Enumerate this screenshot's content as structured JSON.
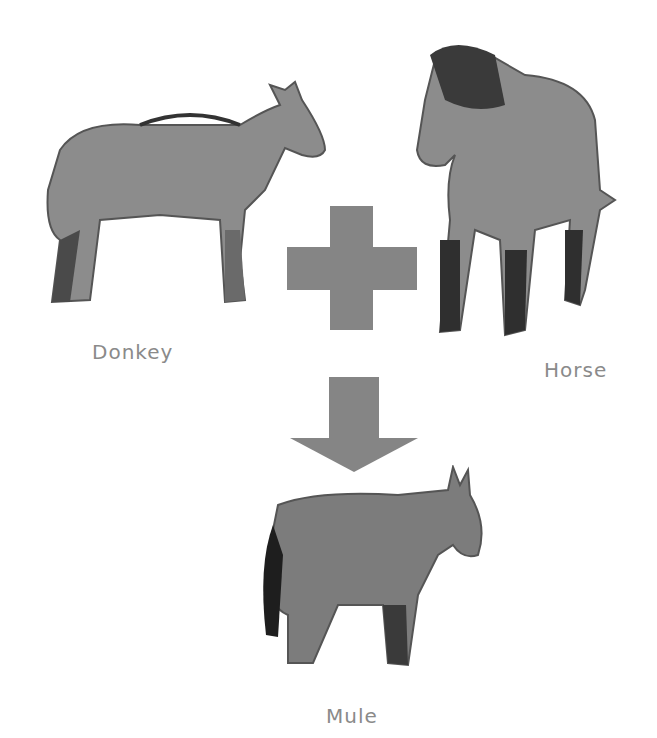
{
  "labels": {
    "donkey": "Donkey",
    "horse": "Horse",
    "mule": "Mule"
  },
  "symbols": {
    "plus": "plus-sign",
    "arrow": "down-arrow"
  },
  "colors": {
    "symbol": "#858585",
    "label": "#8a8a8a",
    "animal_body": "#8c8c8c",
    "animal_dark": "#3a3a3a"
  }
}
